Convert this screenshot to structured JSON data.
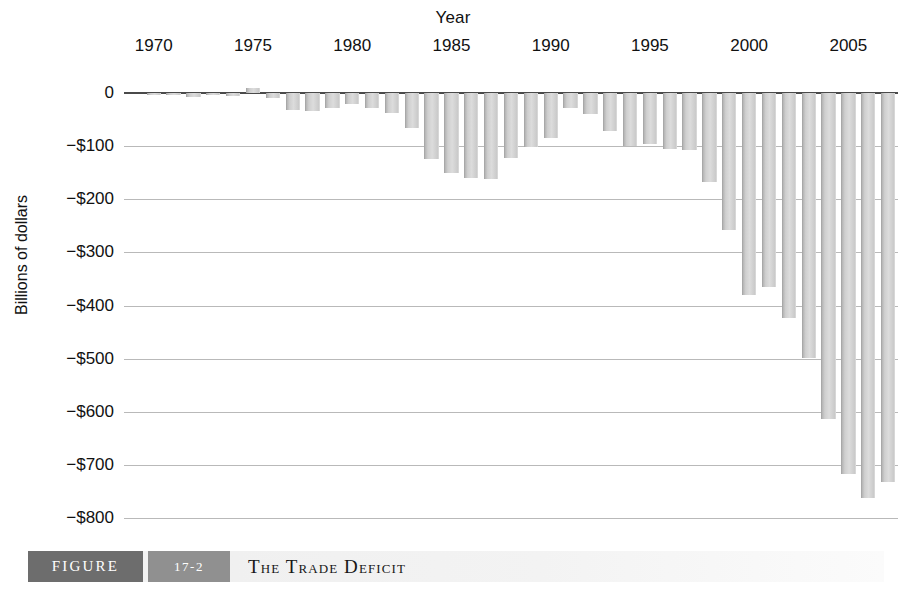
{
  "figure": {
    "label": "FIGURE",
    "number": "17-2",
    "title": "The Trade Deficit"
  },
  "chart_data": {
    "type": "bar",
    "title": "The Trade Deficit",
    "xlabel": "Year",
    "ylabel": "Billions of dollars",
    "grid": true,
    "legend": "none",
    "ylim": [
      -800,
      0
    ],
    "ytick_labels": [
      "0",
      "−$100",
      "−$200",
      "−$300",
      "−$400",
      "−$500",
      "−$600",
      "−$700",
      "−$800"
    ],
    "ytick_values": [
      0,
      -100,
      -200,
      -300,
      -400,
      -500,
      -600,
      -700,
      -800
    ],
    "xtick_labels": [
      "1970",
      "1975",
      "1980",
      "1985",
      "1990",
      "1995",
      "2000",
      "2005"
    ],
    "xtick_values": [
      1970,
      1975,
      1980,
      1985,
      1990,
      1995,
      2000,
      2005
    ],
    "xlim": [
      1969,
      2008
    ],
    "categories": [
      1970,
      1971,
      1972,
      1973,
      1974,
      1975,
      1976,
      1977,
      1978,
      1979,
      1980,
      1981,
      1982,
      1983,
      1984,
      1985,
      1986,
      1987,
      1988,
      1989,
      1990,
      1991,
      1992,
      1993,
      1994,
      1995,
      1996,
      1997,
      1998,
      1999,
      2000,
      2001,
      2002,
      2003,
      2004,
      2005,
      2006,
      2007
    ],
    "values": [
      -2,
      -4,
      -7,
      -1,
      -6,
      10,
      -10,
      -32,
      -34,
      -28,
      -21,
      -29,
      -37,
      -65,
      -124,
      -150,
      -160,
      -162,
      -122,
      -102,
      -84,
      -29,
      -40,
      -71,
      -100,
      -96,
      -105,
      -108,
      -167,
      -258,
      -380,
      -365,
      -424,
      -499,
      -613,
      -717,
      -762,
      -732
    ],
    "units": "Billions of dollars"
  }
}
